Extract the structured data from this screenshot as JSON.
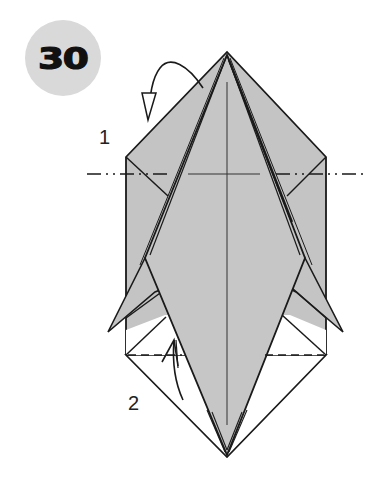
{
  "step": {
    "number": "30",
    "badge_color": "#d9d9d9",
    "number_color": "#111111"
  },
  "annotations": {
    "fold_1_label": "1",
    "fold_2_label": "2"
  },
  "colors": {
    "paper": "#c4c4c4",
    "paper_light": "#cfcfcf",
    "line": "#1a1a1a",
    "background": "#ffffff"
  },
  "folds": [
    {
      "id": "1",
      "type": "mountain-fold",
      "line": "dash-dot",
      "direction": "fold top triangle behind"
    },
    {
      "id": "2",
      "type": "valley-fold",
      "line": "dashed",
      "direction": "fold bottom flap up"
    }
  ]
}
